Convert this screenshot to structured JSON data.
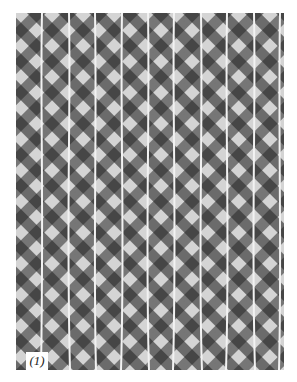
{
  "figure": {
    "label": "(1)",
    "colors": {
      "dark": "#3a3a3a",
      "mid": "#8a8a8a",
      "light": "#e0e0e0",
      "line": "#f2f2f2"
    },
    "vertical_lines_count": 10
  }
}
